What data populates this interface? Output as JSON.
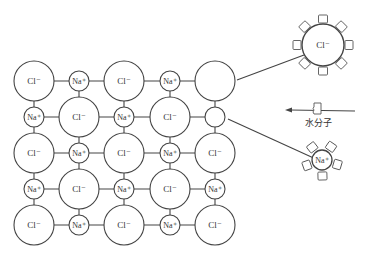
{
  "diagram": {
    "lattice": {
      "rows": [
        [
          "Cl⁻",
          "Na⁺",
          "Cl⁻",
          "Na⁺",
          ""
        ],
        [
          "Na⁺",
          "Cl⁻",
          "Na⁺",
          "Cl⁻",
          ""
        ],
        [
          "Cl⁻",
          "Na⁺",
          "Cl⁻",
          "Na⁺",
          "Cl⁻"
        ],
        [
          "Na⁺",
          "Cl⁻",
          "Na⁺",
          "Cl⁻",
          "Na⁺"
        ],
        [
          "Cl⁻",
          "Na⁺",
          "Cl⁻",
          "Na⁺",
          "Cl⁻"
        ]
      ],
      "vacancies": [
        "row1-col5 (Cl⁻ removed)",
        "row2-col5 (Na⁺ removed)"
      ]
    },
    "hydrated_cl": {
      "label": "Cl⁻",
      "water_count": 8
    },
    "hydrated_na": {
      "label": "Na⁺",
      "water_count": 5
    },
    "water_label": "水分子",
    "labels": {
      "cl": "Cl⁻",
      "na": "Na⁺"
    }
  }
}
